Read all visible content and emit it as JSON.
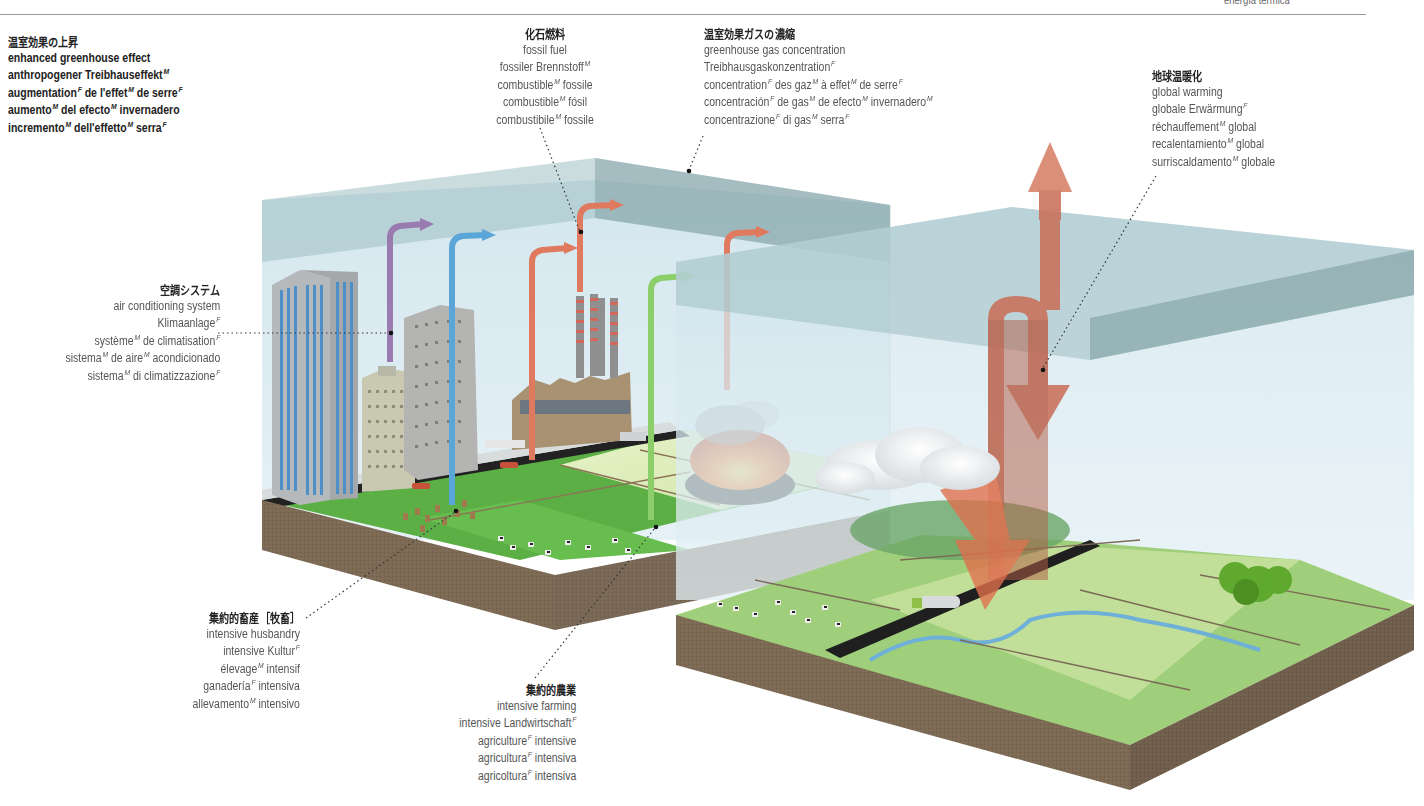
{
  "header": {
    "corner_fragment": "energía térmica"
  },
  "labels": {
    "enhanced_greenhouse_effect": {
      "jp": "温室効果の上昇",
      "terms": [
        "enhanced greenhouse effect",
        "anthropogener Treibhauseffekt^M",
        "augmentation^F de l'effet^M de serre^F",
        "aumento^M del efecto^M invernadero",
        "incremento^M dell'effetto^M serra^F"
      ]
    },
    "fossil_fuel": {
      "jp": "化石燃料",
      "terms": [
        "fossil fuel",
        "fossiler Brennstoff^M",
        "combustible^M fossile",
        "combustible^M fósil",
        "combustibile^M fossile"
      ]
    },
    "greenhouse_gas_concentration": {
      "jp": "温室効果ガスの濃縮",
      "terms": [
        "greenhouse gas concentration",
        "Treibhausgaskonzentration^F",
        "concentration^F des gaz^M à effet^M de serre^F",
        "concentración^F de gas^M de efecto^M invernadero^M",
        "concentrazione^F di gas^M serra^F"
      ]
    },
    "global_warming": {
      "jp": "地球温暖化",
      "terms": [
        "global warming",
        "globale Erwärmung^F",
        "réchauffement^M global",
        "recalentamiento^M global",
        "surriscaldamento^M globale"
      ]
    },
    "air_conditioning_system": {
      "jp": "空調システム",
      "terms": [
        "air conditioning system",
        "Klimaanlage^F",
        "système^M de climatisation^F",
        "sistema^M de aire^M acondicionado",
        "sistema^M di climatizzazione^F"
      ]
    },
    "intensive_husbandry": {
      "jp": "集約的畜産［牧畜］",
      "terms": [
        "intensive husbandry",
        "intensive Kultur^F",
        "élevage^M intensif",
        "ganadería^F intensiva",
        "allevamento^M intensivo"
      ]
    },
    "intensive_farming": {
      "jp": "集約的農業",
      "terms": [
        "intensive farming",
        "intensive Landwirtschaft^F",
        "agriculture^F intensive",
        "agricultura^F intensiva",
        "agricoltura^F intensiva"
      ]
    }
  },
  "colors": {
    "atmosphere_glass": "#bcdbe6",
    "atmosphere_band": "#8fb0b3",
    "ground_soil": "#7a6650",
    "grass": "#5fb84a",
    "field_light": "#d8eab0",
    "arrow_red": "#e07a5f",
    "arrow_purple": "#9a7bb0",
    "arrow_blue": "#5aa6d8",
    "arrow_green": "#8ccf6a",
    "warming_arrow": "#c9705a"
  }
}
